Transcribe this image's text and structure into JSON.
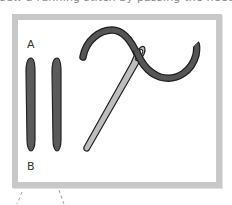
{
  "caption": {
    "top_text": "sew a running stitch by passing the needle through"
  },
  "diagram": {
    "labels": {
      "a": "A",
      "b": "B"
    },
    "elements": [
      {
        "name": "fabric-strip-left",
        "description": "vertical dark grey strip"
      },
      {
        "name": "fabric-strip-right",
        "description": "vertical dark grey strip"
      },
      {
        "name": "needle",
        "description": "diagonal sewing needle"
      },
      {
        "name": "thread",
        "description": "curved dark thread through needle eye"
      }
    ],
    "colors": {
      "frame": "#c8c8c8",
      "strip": "#5a5a5a",
      "strip_outline": "#222222",
      "thread": "#555555",
      "needle": "#bdbdbd",
      "outline": "#1e1e1e"
    }
  }
}
